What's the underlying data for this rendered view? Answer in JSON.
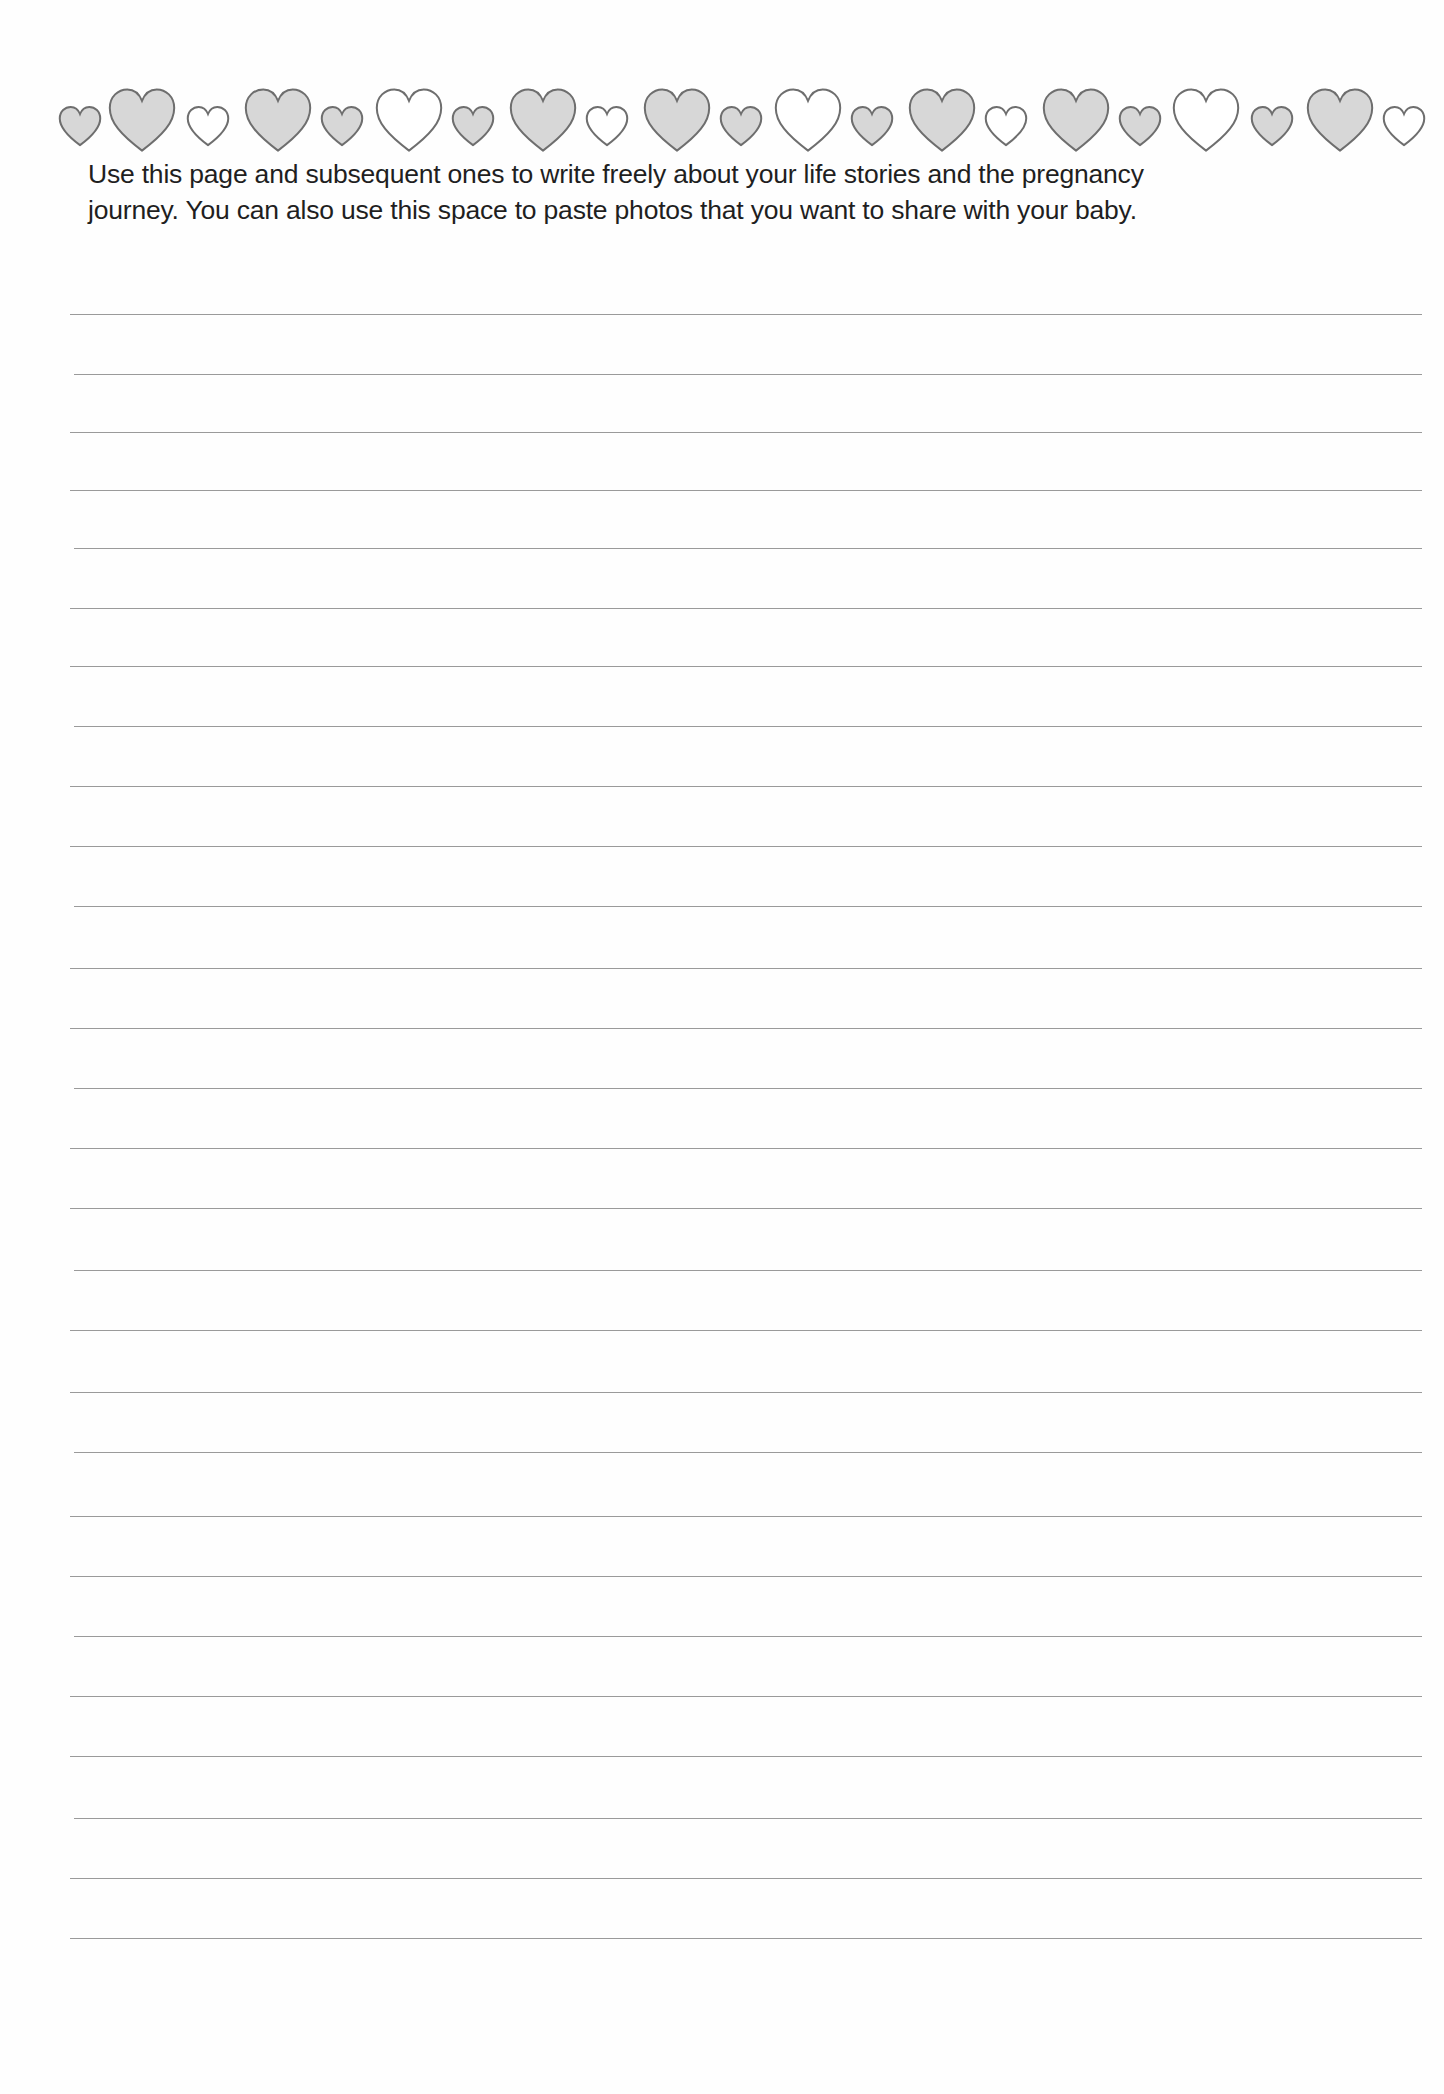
{
  "heart_border": {
    "stroke_color": "#6e6e6e",
    "fill_gray": "#d7d7d7",
    "fill_white": "#ffffff",
    "hearts": [
      {
        "size": "small",
        "fill": "gray"
      },
      {
        "size": "large",
        "fill": "gray"
      },
      {
        "size": "small",
        "fill": "white"
      },
      {
        "size": "large",
        "fill": "gray"
      },
      {
        "size": "small",
        "fill": "gray"
      },
      {
        "size": "large",
        "fill": "white"
      },
      {
        "size": "small",
        "fill": "gray"
      },
      {
        "size": "large",
        "fill": "gray"
      },
      {
        "size": "small",
        "fill": "white"
      },
      {
        "size": "large",
        "fill": "gray"
      },
      {
        "size": "small",
        "fill": "gray"
      },
      {
        "size": "large",
        "fill": "white"
      },
      {
        "size": "small",
        "fill": "gray"
      },
      {
        "size": "large",
        "fill": "gray"
      },
      {
        "size": "small",
        "fill": "white"
      },
      {
        "size": "large",
        "fill": "gray"
      },
      {
        "size": "small",
        "fill": "gray"
      },
      {
        "size": "large",
        "fill": "white"
      },
      {
        "size": "small",
        "fill": "gray"
      },
      {
        "size": "large",
        "fill": "gray"
      },
      {
        "size": "small",
        "fill": "white"
      }
    ]
  },
  "instructions": {
    "line1": "Use this page and subsequent ones to write freely about your life stories and the pregnancy",
    "line2": "journey.  You can also use this space to paste photos that you want to share with your baby."
  },
  "ruled_lines": {
    "count": 28,
    "color": "#9a9a9a",
    "y_positions": [
      314,
      374,
      432,
      490,
      548,
      608,
      666,
      726,
      786,
      846,
      906,
      968,
      1028,
      1088,
      1148,
      1208,
      1270,
      1330,
      1392,
      1452,
      1516,
      1576,
      1636,
      1696,
      1756,
      1818,
      1878,
      1938
    ]
  }
}
